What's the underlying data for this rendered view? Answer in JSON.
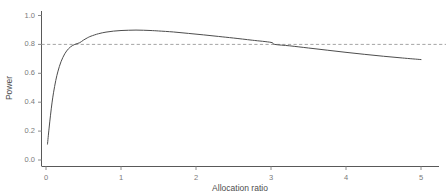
{
  "chart_data": {
    "type": "line",
    "title": "",
    "subtitle": "",
    "xlabel": "Allocation ratio",
    "ylabel": "Power",
    "xlim": [
      -0.1,
      5.15
    ],
    "ylim": [
      -0.02,
      1.04
    ],
    "xticks": [
      0,
      1,
      2,
      3,
      4,
      5
    ],
    "xtick_labels": [
      "0",
      "1",
      "2",
      "3",
      "4",
      "5"
    ],
    "yticks": [
      0.0,
      0.2,
      0.4,
      0.6,
      0.8,
      1.0
    ],
    "ytick_labels": [
      "0.0",
      "0.2",
      "0.4",
      "0.6",
      "0.8",
      "1.0"
    ],
    "grid": false,
    "legend": null,
    "series": [
      {
        "name": "Power curve",
        "color": "#4d4d4d",
        "linestyle": "solid",
        "linewidth": 1.0,
        "x": [
          0.02,
          0.04,
          0.06,
          0.08,
          0.1,
          0.13,
          0.16,
          0.2,
          0.25,
          0.3,
          0.35,
          0.4,
          0.45,
          0.5,
          0.55,
          0.6,
          0.7,
          0.8,
          0.9,
          1.0,
          1.1,
          1.2,
          1.3,
          1.4,
          1.5,
          1.7,
          1.9,
          2.1,
          2.3,
          2.5,
          2.75,
          3.0,
          3.05,
          3.25,
          3.5,
          3.75,
          4.0,
          4.25,
          4.5,
          4.75,
          5.0
        ],
        "y": [
          0.11,
          0.215,
          0.31,
          0.395,
          0.465,
          0.55,
          0.615,
          0.68,
          0.735,
          0.77,
          0.791,
          0.803,
          0.812,
          0.83,
          0.845,
          0.857,
          0.874,
          0.885,
          0.892,
          0.896,
          0.898,
          0.899,
          0.898,
          0.896,
          0.893,
          0.886,
          0.876,
          0.866,
          0.855,
          0.844,
          0.829,
          0.814,
          0.8,
          0.79,
          0.775,
          0.76,
          0.745,
          0.731,
          0.718,
          0.706,
          0.695
        ]
      }
    ],
    "reference_lines": [
      {
        "name": "power-threshold",
        "orientation": "horizontal",
        "value": 0.8,
        "label": "",
        "color": "#9a9a9a",
        "linestyle": "dashed"
      }
    ],
    "annotations": []
  },
  "axes": {
    "x_axis_color": "#595959",
    "y_axis_color": "#595959",
    "tick_color": "#8c8c8c",
    "label_color": "#7a7a7a",
    "title_color": "#4d4d4d"
  }
}
